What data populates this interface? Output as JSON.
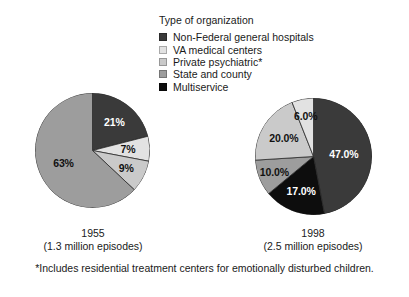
{
  "legend": {
    "title": "Type of organization",
    "items": [
      {
        "label": "Non-Federal general hospitals",
        "color": "#3a3a3a"
      },
      {
        "label": "VA medical centers",
        "color": "#e2e2e2"
      },
      {
        "label": "Private psychiatric*",
        "color": "#cacaca"
      },
      {
        "label": "State and county",
        "color": "#9d9d9d"
      },
      {
        "label": "Multiservice",
        "color": "#0d0d0d"
      }
    ]
  },
  "charts": [
    {
      "name": "pie-1955",
      "year": "1955",
      "episodes": "(1.3 million episodes)",
      "labels": [
        "21%",
        "7%",
        "9%",
        "63%"
      ]
    },
    {
      "name": "pie-1998",
      "year": "1998",
      "episodes": "(2.5 million episodes)",
      "labels": [
        "47.0%",
        "17.0%",
        "10.0%",
        "20.0%",
        "6.0%"
      ]
    }
  ],
  "footnote": "*Includes residential treatment centers for emotionally disturbed children.",
  "chart_data": {
    "type": "pie",
    "title": "Type of organization",
    "legend_position": "top-right",
    "categories": [
      "Non-Federal general hospitals",
      "VA medical centers",
      "Private psychiatric*",
      "State and county",
      "Multiservice"
    ],
    "colors": [
      "#3a3a3a",
      "#e2e2e2",
      "#cacaca",
      "#9d9d9d",
      "#0d0d0d"
    ],
    "series": [
      {
        "name": "1955",
        "subtitle": "(1.3 million episodes)",
        "total_episodes_millions": 1.3,
        "start_angle_deg": 0,
        "direction": "clockwise",
        "slices": [
          {
            "category": "Non-Federal general hospitals",
            "value": 21,
            "label": "21%",
            "color": "#3a3a3a"
          },
          {
            "category": "VA medical centers",
            "value": 7,
            "label": "7%",
            "color": "#e2e2e2"
          },
          {
            "category": "Private psychiatric*",
            "value": 9,
            "label": "9%",
            "color": "#cacaca"
          },
          {
            "category": "State and county",
            "value": 63,
            "label": "63%",
            "color": "#9d9d9d"
          },
          {
            "category": "Multiservice",
            "value": 0,
            "label": "",
            "color": "#0d0d0d"
          }
        ]
      },
      {
        "name": "1998",
        "subtitle": "(2.5 million episodes)",
        "total_episodes_millions": 2.5,
        "start_angle_deg": 0,
        "direction": "clockwise",
        "slices": [
          {
            "category": "Non-Federal general hospitals",
            "value": 47.0,
            "label": "47.0%",
            "color": "#3a3a3a"
          },
          {
            "category": "Multiservice",
            "value": 17.0,
            "label": "17.0%",
            "color": "#0d0d0d"
          },
          {
            "category": "State and county",
            "value": 10.0,
            "label": "10.0%",
            "color": "#9d9d9d"
          },
          {
            "category": "Private psychiatric*",
            "value": 20.0,
            "label": "20.0%",
            "color": "#cacaca"
          },
          {
            "category": "VA medical centers",
            "value": 6.0,
            "label": "6.0%",
            "color": "#e2e2e2"
          }
        ]
      }
    ],
    "footnote": "*Includes residential treatment centers for emotionally disturbed children."
  }
}
